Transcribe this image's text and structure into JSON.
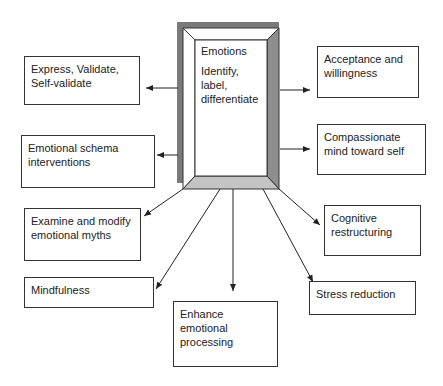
{
  "center": {
    "title": "Emotions",
    "subtitle": "Identify,\nlabel,\ndifferentiate",
    "colors": {
      "shadow": "#7a7a7a",
      "bevel_right": "#8e8e8e",
      "bevel_bottom": "#c4c4c4",
      "bevel_top": "#ffffff",
      "border": "#333333"
    }
  },
  "nodes": [
    {
      "id": "express",
      "label": "Express, Validate,\nSelf-validate"
    },
    {
      "id": "schema",
      "label": "Emotional schema\ninterventions"
    },
    {
      "id": "myths",
      "label": "Examine and modify\nemotional myths"
    },
    {
      "id": "mindfulness",
      "label": "Mindfulness"
    },
    {
      "id": "enhance",
      "label": "Enhance\nemotional\nprocessing"
    },
    {
      "id": "acceptance",
      "label": "Acceptance and\nwillingness"
    },
    {
      "id": "compassion",
      "label": "Compassionate\nmind toward self"
    },
    {
      "id": "cognitive",
      "label": "Cognitive\nrestructuring"
    },
    {
      "id": "stress",
      "label": "Stress reduction"
    }
  ]
}
